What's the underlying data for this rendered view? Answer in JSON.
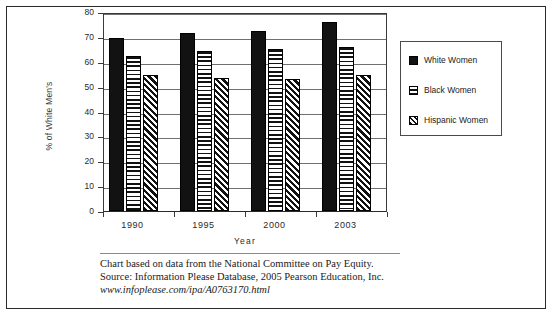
{
  "chart_data": {
    "type": "bar",
    "title": "",
    "subtitle": "",
    "xlabel": "Year",
    "ylabel": "% of White Men's",
    "categories": [
      "1990",
      "1995",
      "2000",
      "2003"
    ],
    "series": [
      {
        "name": "White Women",
        "pattern": "solid-black",
        "values": [
          69.5,
          71.5,
          72.5,
          76.0
        ]
      },
      {
        "name": "Black Women",
        "pattern": "horizontal-stripes",
        "values": [
          62.5,
          64.5,
          65.0,
          66.0
        ]
      },
      {
        "name": "Hispanic Women",
        "pattern": "diagonal-hatch",
        "values": [
          54.5,
          53.5,
          53.0,
          54.5
        ]
      }
    ],
    "ylim": [
      0,
      80
    ],
    "ytick_step": 10,
    "yticks": [
      "80",
      "70",
      "60",
      "50",
      "40",
      "30",
      "20",
      "10",
      "0"
    ],
    "grid": true,
    "grid_axis": "y",
    "legend_position": "right"
  },
  "axes": {
    "y_title": "% of White Men's",
    "x_title": "Year",
    "y_ticks": [
      "80",
      "70",
      "60",
      "50",
      "40",
      "30",
      "20",
      "10",
      "0"
    ],
    "x_ticks": [
      "1990",
      "1995",
      "2000",
      "2003"
    ]
  },
  "legend": {
    "items": [
      {
        "label": "White Women"
      },
      {
        "label": "Black Women"
      },
      {
        "label": "Hispanic Women"
      }
    ]
  },
  "footnote": {
    "line1": "Chart based on data from the National Committee on Pay Equity.",
    "line2": "Source:  Information Please Database, 2005 Pearson Education, Inc.",
    "line3": "www.infoplease.com/ipa/A0763170.html"
  },
  "colors": {
    "series_white_women": "#121212",
    "series_black_women": "#ffffff",
    "series_hispanic_women": "#ffffff",
    "gridline": "#707070",
    "axis": "#3a3a3a",
    "frame": "#2a2a2a",
    "text": "#1a1a1a",
    "background": "#ffffff"
  }
}
